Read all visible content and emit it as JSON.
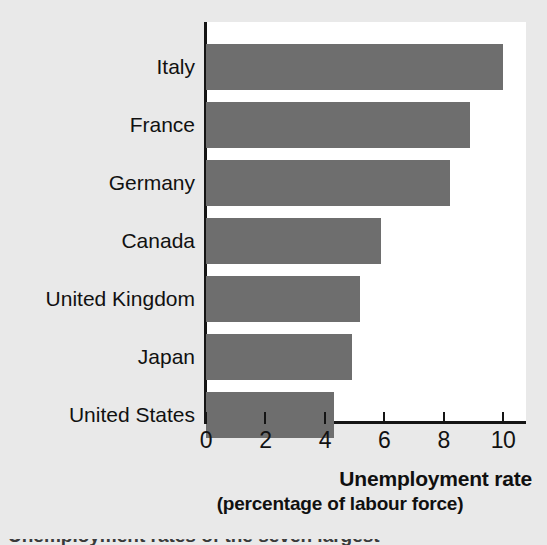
{
  "chart_data": {
    "type": "bar",
    "orientation": "horizontal",
    "title": "",
    "subtitle": "",
    "xlabel": "Unemployment rate",
    "xlabel_line2": "(percentage of labour force)",
    "ylabel": "",
    "categories": [
      "Italy",
      "France",
      "Germany",
      "Canada",
      "United Kingdom",
      "Japan",
      "United States"
    ],
    "values": [
      10.0,
      8.9,
      8.2,
      5.9,
      5.2,
      4.9,
      4.3
    ],
    "xlim": [
      0,
      10.7
    ],
    "xticks": [
      0,
      2,
      4,
      6,
      8,
      10
    ],
    "xtick_labels": [
      "0",
      "2",
      "4",
      "6",
      "8",
      "10"
    ],
    "grid": false,
    "legend": null,
    "bar_color": "#6e6e6e",
    "panel_color": "#ffffff",
    "background_color": "#e9e9e9",
    "axis_color": "#151515"
  },
  "caption_cropped": "Unemployment rates of the seven largest"
}
